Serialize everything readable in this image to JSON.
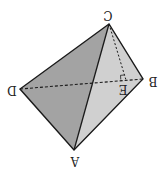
{
  "diagram": {
    "type": "tetrahedron",
    "orientation": "rotated 180 degrees",
    "vertices": {
      "A": {
        "x": 74,
        "y": 150,
        "label": "A"
      },
      "B": {
        "x": 143,
        "y": 79,
        "label": "B"
      },
      "C": {
        "x": 109,
        "y": 24,
        "label": "C"
      },
      "D": {
        "x": 20,
        "y": 89,
        "label": "D"
      },
      "E": {
        "x": 126,
        "y": 80,
        "label": "E"
      }
    },
    "faces": [
      {
        "name": "face-CDA",
        "color": "#a3a3a3"
      },
      {
        "name": "face-CAB",
        "color": "#d0d0d0"
      }
    ],
    "edges": {
      "solid": [
        "CD",
        "DA",
        "AB",
        "BC",
        "CA"
      ],
      "dashed": [
        "DB"
      ],
      "dotted": [
        "CE"
      ]
    },
    "right_angle_at": "E",
    "colors": {
      "edge": "#1a1a1a",
      "label": "#222222"
    }
  }
}
